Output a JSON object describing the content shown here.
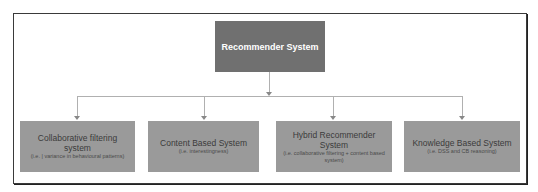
{
  "root": {
    "label": "Recommender System"
  },
  "children": [
    {
      "title": "Collaborative filtering system",
      "subtitle": "(i.e. | variance in behavioural patterns)"
    },
    {
      "title": "Content Based System",
      "subtitle": "(i.e. interestingness)"
    },
    {
      "title": "Hybrid Recommender System",
      "subtitle": "(i.e. collaborative filtering + content based system)"
    },
    {
      "title": "Knowledge Based System",
      "subtitle": "(i.e. DSS and CB reasoning)"
    }
  ],
  "colors": {
    "root_fill": "#707070",
    "child_fill": "#9a9a9a",
    "connector": "#b0b0b0",
    "border": "#3a3a3a"
  }
}
